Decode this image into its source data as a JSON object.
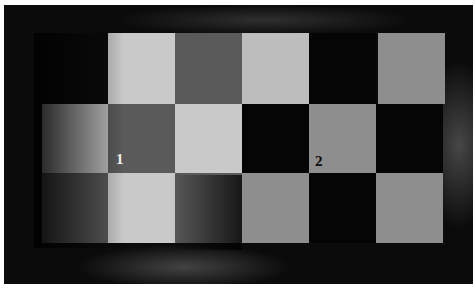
{
  "image": {
    "description": "Photograph of a checkerboard pattern of light and dark paper squares with a shadow, two squares labeled with numbers",
    "labels": [
      {
        "id": "1",
        "text": "1",
        "color": "#f2f2f2"
      },
      {
        "id": "2",
        "text": "2",
        "color": "#0a0a0a"
      }
    ],
    "grid": {
      "rows": 3,
      "columns": 6,
      "cells": [
        [
          "empty",
          "light",
          "dark",
          "light",
          "black",
          "grey"
        ],
        [
          "light",
          "dark",
          "light",
          "black",
          "grey",
          "black"
        ],
        [
          "dark",
          "light",
          "dark",
          "grey",
          "black",
          "grey"
        ]
      ]
    },
    "colors": {
      "background": "#0b0b0b",
      "light_square": "#bdbdbd",
      "dark_square": "#5a5a5a",
      "black_square": "#050505",
      "grey_square": "#8e8e8e"
    }
  },
  "caption": {
    "text": ""
  }
}
